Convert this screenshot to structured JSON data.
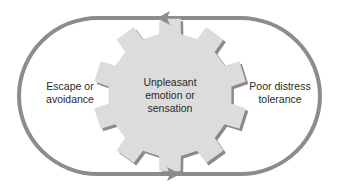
{
  "diagram": {
    "type": "cycle",
    "center": {
      "shape": "gear",
      "lines": [
        "Unpleasant",
        "emotion or",
        "sensation"
      ]
    },
    "left": {
      "lines": [
        "Escape or",
        "avoidance"
      ]
    },
    "right": {
      "lines": [
        "Poor distress",
        "tolerance"
      ]
    },
    "arrows": [
      {
        "position": "top",
        "direction": "left"
      },
      {
        "position": "bottom",
        "direction": "right"
      }
    ],
    "colors": {
      "loop": "#8c8c8c",
      "gear_fill": "#dcdcdc",
      "gear_shadow": "#8a8a8a",
      "text": "#2a2a2a"
    }
  }
}
